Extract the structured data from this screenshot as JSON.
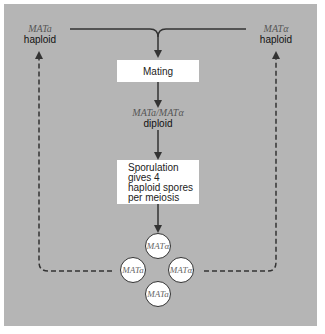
{
  "diagram": {
    "left_haploid": {
      "genotype": "MATa",
      "ploidy": "haploid"
    },
    "right_haploid": {
      "genotype": "MATα",
      "ploidy": "haploid"
    },
    "mating_box": "Mating",
    "diploid": {
      "genotype": "MATa/MATα",
      "ploidy": "diploid"
    },
    "sporulation_box": [
      "Sporulation",
      "gives 4",
      "haploid spores",
      "per meiosis"
    ],
    "spores": [
      {
        "position": "top",
        "genotype": "MATα"
      },
      {
        "position": "left",
        "genotype": "MATa"
      },
      {
        "position": "right",
        "genotype": "MATα"
      },
      {
        "position": "bottom",
        "genotype": "MATa"
      }
    ],
    "colors": {
      "background": "#b5b5b5",
      "line": "#333333",
      "box": "#ffffff"
    }
  }
}
